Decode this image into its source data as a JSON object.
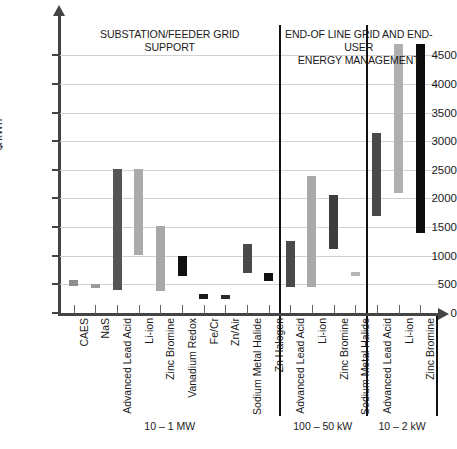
{
  "chart_data": {
    "type": "bar",
    "subtype": "floating-range-bar",
    "title": "",
    "xlabel": "",
    "ylabel": "$/kWh",
    "ylim": [
      0,
      4750
    ],
    "yticks": [
      0,
      500,
      1000,
      1500,
      2000,
      2500,
      3000,
      3500,
      4000,
      4500
    ],
    "ytick_labels": [
      "0",
      "500",
      "1000",
      "1500",
      "2000",
      "2500",
      "3000",
      "3500",
      "4000",
      "4500"
    ],
    "grid": true,
    "legend": "none",
    "sections": [
      {
        "title": "SUBSTATION/FEEDER GRID SUPPORT",
        "power_label": "10 – 1 MW",
        "categories": [
          "CAES",
          "NaS",
          "Advanced Lead Acid",
          "Li-ion",
          "Zinc Bromine",
          "Vanadium Redox",
          "Fe/Cr",
          "Zn/Air",
          "Sodium Metal Halide",
          "Zn Halogen"
        ],
        "bars": [
          {
            "label": "CAES",
            "low": 480,
            "high": 580,
            "color": "#8d8d8d"
          },
          {
            "label": "NaS",
            "low": 440,
            "high": 500,
            "color": "#9a9a9a"
          },
          {
            "label": "Advanced Lead Acid",
            "low": 400,
            "high": 2510,
            "color": "#555555"
          },
          {
            "label": "Li-ion",
            "low": 1020,
            "high": 2510,
            "color": "#aaaaaa"
          },
          {
            "label": "Zinc Bromine",
            "low": 380,
            "high": 1520,
            "color": "#a8a8a8"
          },
          {
            "label": "Vanadium Redox",
            "low": 650,
            "high": 1000,
            "color": "#111111"
          },
          {
            "label": "Fe/Cr",
            "low": 250,
            "high": 330,
            "color": "#1a1a1a"
          },
          {
            "label": "Zn/Air",
            "low": 250,
            "high": 310,
            "color": "#2a2a2a"
          },
          {
            "label": "Sodium Metal Halide",
            "low": 700,
            "high": 1200,
            "color": "#4a4a4a"
          },
          {
            "label": "Zn Halogen",
            "low": 560,
            "high": 700,
            "color": "#111111"
          }
        ]
      },
      {
        "title": "END-OF LINE GRID AND END-USER ENERGY MANAGEMENT",
        "power_label": "100 – 50 kW",
        "categories": [
          "Advanced Lead Acid",
          "Li-ion",
          "Zinc Bromine",
          "Sodium Metal Halide"
        ],
        "bars": [
          {
            "label": "Advanced Lead Acid",
            "low": 450,
            "high": 1260,
            "color": "#4a4a4a"
          },
          {
            "label": "Li-ion",
            "low": 450,
            "high": 2400,
            "color": "#aaaaaa"
          },
          {
            "label": "Zinc Bromine",
            "low": 1110,
            "high": 2060,
            "color": "#3d3d3d"
          },
          {
            "label": "Sodium Metal Halide",
            "low": 640,
            "high": 720,
            "color": "#b5b5b5"
          }
        ]
      },
      {
        "title": "",
        "power_label": "10 – 2 kW",
        "categories": [
          "Advanced Lead Acid",
          "Li-ion",
          "Zinc Bromine"
        ],
        "bars": [
          {
            "label": "Advanced Lead Acid",
            "low": 1700,
            "high": 3150,
            "color": "#4a4a4a"
          },
          {
            "label": "Li-ion",
            "low": 2100,
            "high": 4700,
            "color": "#b0b0b0"
          },
          {
            "label": "Zinc Bromine",
            "low": 1400,
            "high": 4700,
            "color": "#0d0d0d"
          }
        ]
      }
    ]
  },
  "axis": {
    "y_title": "$/kWh"
  },
  "section_titles": {
    "left_line1": "SUBSTATION/FEEDER GRID",
    "left_line2": "SUPPORT",
    "right_line1": "END-OF LINE GRID AND END-USER",
    "right_line2": "ENERGY MANAGEMENT"
  },
  "group_labels": {
    "g1": "10 – 1 MW",
    "g2": "100 – 50 kW",
    "g3": "10 – 2 kW"
  }
}
